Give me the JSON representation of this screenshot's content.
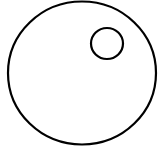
{
  "diagram": {
    "background": "#ffffff",
    "stroke_color": "#000000",
    "shapes": [
      {
        "id": "outer-circle",
        "type": "ellipse",
        "cx": 82,
        "cy": 73,
        "rx": 74,
        "ry": 71.5,
        "stroke_width": 2.2,
        "fill": "none"
      },
      {
        "id": "inner-circle",
        "type": "ellipse",
        "cx": 107,
        "cy": 43.5,
        "rx": 16,
        "ry": 15.5,
        "stroke_width": 2.2,
        "fill": "none"
      }
    ]
  }
}
